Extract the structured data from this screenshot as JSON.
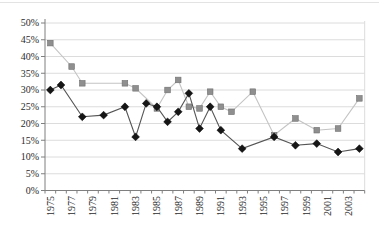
{
  "chart_data": {
    "type": "line",
    "title": "",
    "xlabel": "",
    "ylabel": "",
    "legend": "none",
    "grid": true,
    "y_axis": {
      "min": 0,
      "max": 50,
      "step": 5,
      "tick_labels": [
        "0%",
        "5%",
        "10%",
        "15%",
        "20%",
        "25%",
        "30%",
        "35%",
        "40%",
        "45%",
        "50%"
      ]
    },
    "x_axis": {
      "first_year": 1975,
      "last_year": 2004,
      "tick_every_years": 1,
      "label_years": [
        1975,
        1977,
        1979,
        1981,
        1983,
        1985,
        1987,
        1989,
        1991,
        1993,
        1995,
        1997,
        1999,
        2001,
        2003
      ]
    },
    "series": [
      {
        "name": "gray-squares-series",
        "marker": "square",
        "marker_color": "#8f8f8f",
        "marker_edge": "#6f6f6f",
        "line_color": "#c4c4c4",
        "points": [
          [
            1975,
            44
          ],
          [
            1977,
            37
          ],
          [
            1978,
            32
          ],
          [
            1982,
            32
          ],
          [
            1983,
            30.5
          ],
          [
            1985,
            24.5
          ],
          [
            1986,
            30
          ],
          [
            1987,
            33
          ],
          [
            1988,
            25
          ],
          [
            1989,
            24.5
          ],
          [
            1990,
            29.5
          ],
          [
            1991,
            25
          ],
          [
            1992,
            23.5
          ],
          [
            1994,
            29.5
          ],
          [
            1996,
            16.5
          ],
          [
            1998,
            21.5
          ],
          [
            2000,
            18
          ],
          [
            2002,
            18.5
          ],
          [
            2004,
            27.5
          ]
        ]
      },
      {
        "name": "black-diamonds-series",
        "marker": "diamond",
        "marker_color": "#161616",
        "marker_edge": "#000000",
        "line_color": "#555555",
        "points": [
          [
            1975,
            30
          ],
          [
            1976,
            31.5
          ],
          [
            1978,
            22
          ],
          [
            1980,
            22.5
          ],
          [
            1982,
            25
          ],
          [
            1983,
            16
          ],
          [
            1984,
            26
          ],
          [
            1985,
            25
          ],
          [
            1986,
            20.5
          ],
          [
            1987,
            23.5
          ],
          [
            1988,
            29
          ],
          [
            1989,
            18.5
          ],
          [
            1990,
            25
          ],
          [
            1991,
            18
          ],
          [
            1993,
            12.5
          ],
          [
            1996,
            16
          ],
          [
            1998,
            13.5
          ],
          [
            2000,
            14
          ],
          [
            2002,
            11.5
          ],
          [
            2004,
            12.5
          ]
        ]
      }
    ],
    "colors": {
      "gridline": "#dcdcdc",
      "axis": "#7f7f7f",
      "tick_text": "#2b2b2b",
      "plot_right_border": "#dcdcdc"
    }
  }
}
